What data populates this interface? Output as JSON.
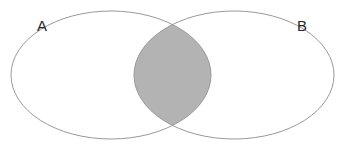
{
  "figure": {
    "type": "venn-diagram",
    "title": "",
    "background_color": "#ffffff",
    "width": 346,
    "height": 148
  },
  "sets": [
    {
      "id": "A",
      "label": "A",
      "label_x": 42,
      "label_y": 27,
      "cx": 111,
      "cy": 75,
      "rx": 100,
      "ry": 64,
      "fill": "none",
      "stroke": "#999999",
      "stroke_width": 1
    },
    {
      "id": "B",
      "label": "B",
      "label_x": 302,
      "label_y": 27,
      "cx": 234,
      "cy": 75,
      "rx": 100,
      "ry": 64,
      "fill": "none",
      "stroke": "#999999",
      "stroke_width": 1
    }
  ],
  "intersection": {
    "label": "",
    "shaded": true,
    "fill": "#b3b3b3",
    "stroke": "#999999",
    "top_crossing_x": 172,
    "top_crossing_y": 24,
    "bottom_crossing_x": 172,
    "bottom_crossing_y": 124,
    "left_extent_x": 133,
    "right_extent_x": 211
  },
  "colors": {
    "stroke": "#999999",
    "intersection_fill": "#b3b3b3",
    "label_text": "#262626",
    "background": "#ffffff"
  }
}
